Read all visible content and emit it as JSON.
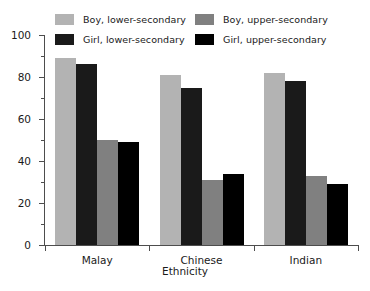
{
  "chart_data": {
    "type": "bar",
    "title": "",
    "subtitle": "",
    "xlabel": "Ethnicity",
    "ylabel": "",
    "categories": [
      "Malay",
      "Chinese",
      "Indian"
    ],
    "series": [
      {
        "name": "Boy, lower-secondary",
        "color": "#b3b3b3",
        "values": [
          89,
          81,
          82
        ]
      },
      {
        "name": "Girl, lower-secondary",
        "color": "#1a1a1a",
        "values": [
          86,
          75,
          78
        ]
      },
      {
        "name": "Boy, upper-secondary",
        "color": "#808080",
        "values": [
          50,
          31,
          33
        ]
      },
      {
        "name": "Girl, upper-secondary",
        "color": "#000000",
        "values": [
          49,
          34,
          29
        ]
      }
    ],
    "ylim": [
      0,
      100
    ],
    "y_major_ticks": [
      0,
      20,
      40,
      60,
      80,
      100
    ],
    "y_minor_ticks": [
      10,
      30,
      50,
      70,
      90
    ],
    "y_tick_labels": [
      "0",
      "20",
      "40",
      "60",
      "80",
      "100"
    ],
    "grid": false,
    "legend_position": "top",
    "legend_columns": 2,
    "annotations": []
  },
  "legend": {
    "entries": [
      {
        "label": "Boy, lower-secondary",
        "color": "#b3b3b3"
      },
      {
        "label": "Boy, upper-secondary",
        "color": "#808080"
      },
      {
        "label": "Girl, lower-secondary",
        "color": "#1a1a1a"
      },
      {
        "label": "Girl, upper-secondary",
        "color": "#000000"
      }
    ]
  },
  "axes": {
    "x_title": "Ethnicity",
    "y_labels": [
      "100",
      "80",
      "60",
      "40",
      "20",
      "0"
    ],
    "category_labels": [
      "Malay",
      "Chinese",
      "Indian"
    ]
  }
}
